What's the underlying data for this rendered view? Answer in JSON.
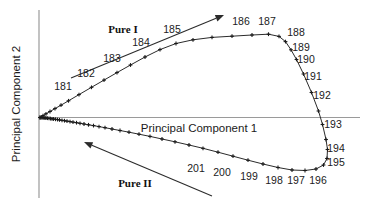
{
  "chart_data": {
    "type": "line",
    "title": "",
    "xlabel": "Principal Component 1",
    "ylabel": "Principal Component 2",
    "grid": false,
    "legend": null,
    "annotations": [
      {
        "text": "Pure I",
        "role": "direction-label-upper"
      },
      {
        "text": "Pure II",
        "role": "direction-label-lower"
      }
    ],
    "series": [
      {
        "name": "score-trajectory",
        "marker": "plus",
        "points": [
          {
            "x": 40.0,
            "y": 117.5,
            "label": null
          },
          {
            "x": 43.0,
            "y": 115.6,
            "label": null
          },
          {
            "x": 46.0,
            "y": 113.8,
            "label": null
          },
          {
            "x": 50.0,
            "y": 111.5,
            "label": null
          },
          {
            "x": 55.0,
            "y": 108.6,
            "label": null
          },
          {
            "x": 61.0,
            "y": 105.2,
            "label": null
          },
          {
            "x": 68.5,
            "y": 100.8,
            "label": "181"
          },
          {
            "x": 79.0,
            "y": 94.6,
            "label": null
          },
          {
            "x": 91.5,
            "y": 87.3,
            "label": "182"
          },
          {
            "x": 104.0,
            "y": 80.1,
            "label": null
          },
          {
            "x": 117.0,
            "y": 72.6,
            "label": "183"
          },
          {
            "x": 130.5,
            "y": 65.0,
            "label": null
          },
          {
            "x": 145.0,
            "y": 57.0,
            "label": "184"
          },
          {
            "x": 160.0,
            "y": 49.6,
            "label": null
          },
          {
            "x": 176.0,
            "y": 43.5,
            "label": "185"
          },
          {
            "x": 193.0,
            "y": 39.8,
            "label": null
          },
          {
            "x": 212.0,
            "y": 37.4,
            "label": null
          },
          {
            "x": 232.0,
            "y": 36.2,
            "label": null
          },
          {
            "x": 252.0,
            "y": 35.0,
            "label": "186"
          },
          {
            "x": 268.5,
            "y": 34.2,
            "label": "187"
          },
          {
            "x": 279.0,
            "y": 36.4,
            "label": null
          },
          {
            "x": 285.5,
            "y": 41.6,
            "label": "188"
          },
          {
            "x": 291.0,
            "y": 49.8,
            "label": "189"
          },
          {
            "x": 296.5,
            "y": 59.5,
            "label": "190"
          },
          {
            "x": 303.5,
            "y": 74.0,
            "label": "191"
          },
          {
            "x": 311.5,
            "y": 92.5,
            "label": "192"
          },
          {
            "x": 318.5,
            "y": 111.0,
            "label": null
          },
          {
            "x": 322.5,
            "y": 124.5,
            "label": "193"
          },
          {
            "x": 326.0,
            "y": 139.5,
            "label": null
          },
          {
            "x": 327.5,
            "y": 149.5,
            "label": "194"
          },
          {
            "x": 327.0,
            "y": 158.5,
            "label": "195"
          },
          {
            "x": 323.5,
            "y": 165.0,
            "label": null
          },
          {
            "x": 316.0,
            "y": 169.0,
            "label": "196"
          },
          {
            "x": 305.0,
            "y": 170.5,
            "label": "197"
          },
          {
            "x": 292.0,
            "y": 170.0,
            "label": "198"
          },
          {
            "x": 278.0,
            "y": 167.5,
            "label": null
          },
          {
            "x": 263.0,
            "y": 164.0,
            "label": "199"
          },
          {
            "x": 248.0,
            "y": 160.2,
            "label": null
          },
          {
            "x": 233.0,
            "y": 156.2,
            "label": "200"
          },
          {
            "x": 218.0,
            "y": 152.2,
            "label": null
          },
          {
            "x": 203.0,
            "y": 148.3,
            "label": "201"
          },
          {
            "x": 189.0,
            "y": 145.0,
            "label": null
          },
          {
            "x": 175.0,
            "y": 141.8,
            "label": null
          },
          {
            "x": 162.0,
            "y": 139.0,
            "label": null
          },
          {
            "x": 150.0,
            "y": 136.4,
            "label": null
          },
          {
            "x": 139.0,
            "y": 134.2,
            "label": null
          },
          {
            "x": 129.0,
            "y": 132.2,
            "label": null
          },
          {
            "x": 120.0,
            "y": 130.5,
            "label": null
          },
          {
            "x": 112.0,
            "y": 129.0,
            "label": null
          },
          {
            "x": 105.0,
            "y": 127.7,
            "label": null
          },
          {
            "x": 99.0,
            "y": 126.6,
            "label": null
          },
          {
            "x": 93.5,
            "y": 125.6,
            "label": null
          },
          {
            "x": 88.5,
            "y": 124.8,
            "label": null
          },
          {
            "x": 84.0,
            "y": 124.0,
            "label": null
          },
          {
            "x": 80.0,
            "y": 123.3,
            "label": null
          },
          {
            "x": 76.5,
            "y": 122.7,
            "label": null
          },
          {
            "x": 73.0,
            "y": 122.1,
            "label": null
          },
          {
            "x": 70.0,
            "y": 121.6,
            "label": null
          },
          {
            "x": 67.0,
            "y": 121.1,
            "label": null
          },
          {
            "x": 64.5,
            "y": 120.7,
            "label": null
          },
          {
            "x": 62.0,
            "y": 120.3,
            "label": null
          },
          {
            "x": 59.5,
            "y": 119.9,
            "label": null
          },
          {
            "x": 57.5,
            "y": 119.6,
            "label": null
          },
          {
            "x": 55.5,
            "y": 119.3,
            "label": null
          },
          {
            "x": 53.5,
            "y": 119.0,
            "label": null
          },
          {
            "x": 52.0,
            "y": 118.8,
            "label": null
          },
          {
            "x": 50.5,
            "y": 118.6,
            "label": null
          },
          {
            "x": 49.0,
            "y": 118.4,
            "label": null
          },
          {
            "x": 47.5,
            "y": 118.2,
            "label": null
          },
          {
            "x": 46.0,
            "y": 118.0,
            "label": null
          },
          {
            "x": 45.0,
            "y": 117.9,
            "label": null
          },
          {
            "x": 44.0,
            "y": 117.8,
            "label": null
          },
          {
            "x": 43.0,
            "y": 117.7,
            "label": null
          },
          {
            "x": 42.0,
            "y": 117.6,
            "label": null
          },
          {
            "x": 41.0,
            "y": 117.55,
            "label": null
          },
          {
            "x": 40.0,
            "y": 117.5,
            "label": null
          }
        ]
      }
    ],
    "point_labels": [
      {
        "text": "181",
        "x": 63,
        "y": 90
      },
      {
        "text": "182",
        "x": 86,
        "y": 77
      },
      {
        "text": "183",
        "x": 112,
        "y": 62
      },
      {
        "text": "184",
        "x": 141,
        "y": 46
      },
      {
        "text": "185",
        "x": 172,
        "y": 33
      },
      {
        "text": "186",
        "x": 241,
        "y": 25
      },
      {
        "text": "187",
        "x": 267,
        "y": 25
      },
      {
        "text": "188",
        "x": 296,
        "y": 36
      },
      {
        "text": "189",
        "x": 301,
        "y": 51
      },
      {
        "text": "190",
        "x": 306,
        "y": 63
      },
      {
        "text": "191",
        "x": 313,
        "y": 80
      },
      {
        "text": "192",
        "x": 322,
        "y": 99
      },
      {
        "text": "193",
        "x": 333,
        "y": 128
      },
      {
        "text": "194",
        "x": 336,
        "y": 152
      },
      {
        "text": "195",
        "x": 336,
        "y": 166
      },
      {
        "text": "196",
        "x": 318,
        "y": 184
      },
      {
        "text": "197",
        "x": 296,
        "y": 184
      },
      {
        "text": "198",
        "x": 274,
        "y": 184
      },
      {
        "text": "199",
        "x": 249,
        "y": 180
      },
      {
        "text": "200",
        "x": 222,
        "y": 176
      },
      {
        "text": "201",
        "x": 196,
        "y": 172
      }
    ],
    "direction_arrows": [
      {
        "name": "pure-1-arrow",
        "x1": 71,
        "y1": 78,
        "x2": 224,
        "y2": 15
      },
      {
        "name": "pure-2-arrow",
        "x1": 212,
        "y1": 196,
        "x2": 84,
        "y2": 142
      }
    ],
    "axes": {
      "x_axis": {
        "x1": 39,
        "y1": 117.5,
        "x2": 360,
        "y2": 117.5
      },
      "y_axis": {
        "x1": 39,
        "y1": 10,
        "x2": 39,
        "y2": 198
      }
    },
    "xlim": [
      39,
      360
    ],
    "ylim": [
      10,
      198
    ],
    "colors": {
      "axis": "#9a9a9a",
      "data": "#2b2b2b",
      "text": "#1b1b1b",
      "background": "#ffffff"
    }
  },
  "labels": {
    "x_axis_title": "Principal Component 1",
    "y_axis_title": "Principal Component 2",
    "pure_one": "Pure I",
    "pure_two": "Pure II"
  }
}
